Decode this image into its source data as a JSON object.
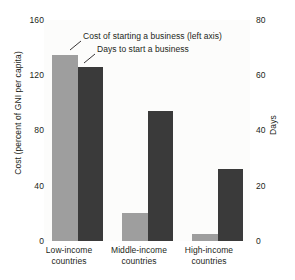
{
  "chart_data": {
    "type": "bar",
    "title": "",
    "categories": [
      "Low-income countries",
      "Middle-income countries",
      "High-income countries"
    ],
    "category_lines": [
      [
        "Low-income",
        "countries"
      ],
      [
        "Middle-income",
        "countries"
      ],
      [
        "High-income",
        "countries"
      ]
    ],
    "series": [
      {
        "name": "Cost of starting a business (left axis)",
        "axis": "left",
        "color": "#9e9e9e",
        "values": [
          135,
          20,
          5
        ]
      },
      {
        "name": "Days to start a business",
        "axis": "right",
        "color": "#3a3a3a",
        "values": [
          63,
          47,
          26
        ]
      }
    ],
    "xlabel": "",
    "ylabel": "Cost (percent of GNI per capita)",
    "y2label": "Days",
    "ylim": [
      0,
      160
    ],
    "y2lim": [
      0,
      80
    ],
    "yticks": [
      0,
      40,
      80,
      120,
      160
    ],
    "y2ticks": [
      0,
      20,
      40,
      60,
      80
    ],
    "grid": false,
    "legend": "annotations-with-leader-lines"
  },
  "axes": {
    "left": {
      "title": "Cost (percent of GNI per capita)",
      "ticks": [
        "160",
        "120",
        "80",
        "40",
        "0"
      ]
    },
    "right": {
      "title": "Days",
      "ticks": [
        "80",
        "60",
        "40",
        "20",
        "0"
      ]
    }
  },
  "annotations": {
    "cost": "Cost of starting a business (left axis)",
    "days": "Days to start a business"
  },
  "colors": {
    "cost_bar": "#9e9e9e",
    "days_bar": "#3a3a3a",
    "plot_background": "#fcfcfb",
    "text": "#231f20"
  }
}
